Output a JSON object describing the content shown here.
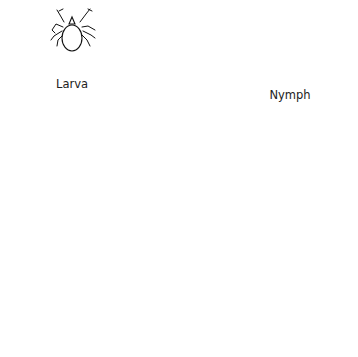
{
  "figure": {
    "stages": [
      {
        "id": "larva",
        "label": "Larva"
      },
      {
        "id": "nymph",
        "label": "Nymph"
      },
      {
        "id": "adult-female",
        "label": ""
      },
      {
        "id": "adult-male",
        "label": ""
      }
    ]
  }
}
